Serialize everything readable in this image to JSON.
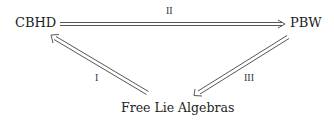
{
  "diagram": {
    "nodes": {
      "cbhd": "CBHD",
      "pbw": "PBW",
      "free_lie": "Free Lie Algebras"
    },
    "edges": [
      {
        "from": "CBHD",
        "to": "PBW",
        "label": "II",
        "style": "double-arrow"
      },
      {
        "from": "Free Lie Algebras",
        "to": "CBHD",
        "label": "I",
        "style": "double-arrow"
      },
      {
        "from": "PBW",
        "to": "Free Lie Algebras",
        "label": "III",
        "style": "double-arrow"
      }
    ]
  }
}
